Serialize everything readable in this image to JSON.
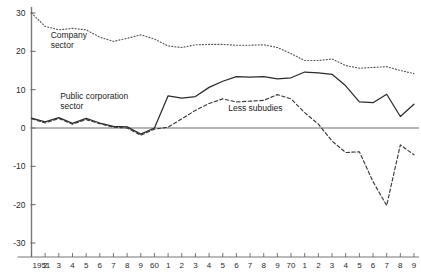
{
  "chart_data": {
    "type": "line",
    "title": "",
    "subtitle": "",
    "xlabel": "",
    "ylabel": "",
    "xlim": [
      1951,
      1979
    ],
    "ylim": [
      -30,
      30
    ],
    "grid": false,
    "legend_position": "inline-annotations",
    "y_ticks": [
      30,
      20,
      10,
      0,
      -10,
      -20,
      -30
    ],
    "y_tick_labels": [
      "30",
      "20",
      "10",
      "0",
      "-10",
      "-20",
      "-30"
    ],
    "x": [
      1951,
      1952,
      1953,
      1954,
      1955,
      1956,
      1957,
      1958,
      1959,
      1960,
      1961,
      1962,
      1963,
      1964,
      1965,
      1966,
      1967,
      1968,
      1969,
      1970,
      1971,
      1972,
      1973,
      1974,
      1975,
      1976,
      1977,
      1978,
      1979
    ],
    "x_tick_labels": [
      "1951",
      "2",
      "3",
      "4",
      "5",
      "6",
      "7",
      "8",
      "9",
      "60",
      "1",
      "2",
      "3",
      "4",
      "5",
      "6",
      "7",
      "8",
      "9",
      "70",
      "1",
      "2",
      "3",
      "4",
      "5",
      "6",
      "7",
      "8",
      "9"
    ],
    "series": [
      {
        "name": "Company sector",
        "style": "dotted",
        "color": "#555555",
        "values": [
          30.0,
          26.5,
          25.6,
          26.0,
          25.6,
          23.7,
          22.6,
          23.4,
          24.3,
          23.2,
          21.4,
          21.0,
          21.7,
          21.8,
          21.8,
          21.6,
          21.6,
          21.7,
          21.0,
          19.4,
          17.6,
          17.6,
          18.0,
          16.3,
          15.6,
          15.8,
          16.0,
          15.0,
          14.2
        ]
      },
      {
        "name": "Public corporation sector",
        "style": "solid",
        "color": "#2b2b2b",
        "values": [
          2.6,
          1.6,
          2.7,
          1.2,
          2.5,
          1.3,
          0.4,
          0.3,
          -1.6,
          0.0,
          8.4,
          7.8,
          8.2,
          10.6,
          12.2,
          13.4,
          13.3,
          13.4,
          12.8,
          13.1,
          14.6,
          14.4,
          14.0,
          11.0,
          6.8,
          6.6,
          8.8,
          3.0,
          6.2
        ]
      },
      {
        "name": "Less subudies",
        "style": "dashed",
        "color": "#3a3a3a",
        "values": [
          2.4,
          1.3,
          2.5,
          1.0,
          2.2,
          1.1,
          0.2,
          0.0,
          -1.9,
          -0.3,
          0.2,
          2.4,
          4.6,
          6.4,
          7.6,
          6.8,
          7.0,
          7.2,
          8.7,
          7.6,
          4.0,
          1.0,
          -3.4,
          -6.4,
          -6.2,
          -14.0,
          -20.2,
          -4.4,
          -7.0
        ]
      }
    ],
    "annotations": [
      {
        "text_line1": "Company",
        "text_line2": "sector",
        "x": 1952.4,
        "y": 23.5
      },
      {
        "text_line1": "Public corporation",
        "text_line2": "sector",
        "x": 1953.1,
        "y": 7.6
      },
      {
        "text_line1": "Less subudies",
        "text_line2": "",
        "x": 1965.4,
        "y": 4.4
      }
    ],
    "zero_line": 0
  }
}
